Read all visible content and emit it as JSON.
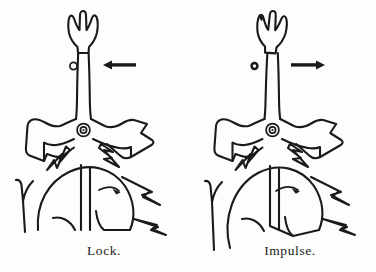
{
  "figure": {
    "background_color": "#fdfdfb",
    "ink_color": "#1a1a1a",
    "panels": [
      {
        "id": "lock",
        "caption": "Lock.",
        "balance_arrow_direction": "left",
        "balance_arrow_symbol": "←",
        "escape_wheel_arrow_direction": "right",
        "roller_jewel_state": "against-fork-notch",
        "fork_tilt_degrees": 0
      },
      {
        "id": "impulse",
        "caption": "Impulse.",
        "balance_arrow_direction": "right",
        "balance_arrow_symbol": "→",
        "escape_wheel_arrow_direction": "right",
        "roller_jewel_state": "detached-clear-of-notch",
        "fork_tilt_degrees": 4
      }
    ],
    "parts": [
      "fork-horns",
      "fork-stem",
      "pallet-fork-body",
      "pallet-arbor-pivot",
      "entry-pallet-stone",
      "exit-pallet-stone",
      "escape-wheel",
      "escape-wheel-teeth",
      "roller-jewel"
    ]
  },
  "captions": {
    "left": "Lock.",
    "right": "Impulse."
  }
}
